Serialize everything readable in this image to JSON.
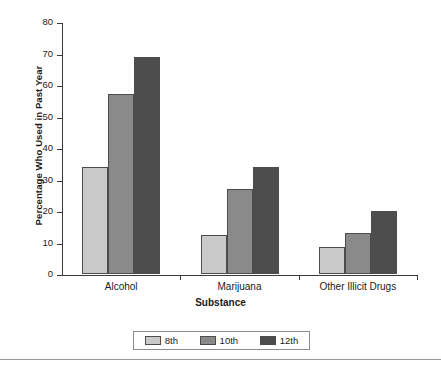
{
  "chart_data": {
    "type": "bar",
    "title": "",
    "xlabel": "Substance",
    "ylabel": "Percentage Who Used in Past Year",
    "categories": [
      "Alcohol",
      "Marijuana",
      "Other Illicit Drugs"
    ],
    "series": [
      {
        "name": "8th",
        "values": [
          34,
          12.5,
          8.5
        ],
        "color": "#c9c9c9"
      },
      {
        "name": "10th",
        "values": [
          57,
          27,
          13
        ],
        "color": "#8a8a8a"
      },
      {
        "name": "12th",
        "values": [
          69,
          34,
          20
        ],
        "color": "#4d4d4d"
      }
    ],
    "ylim": [
      0,
      80
    ],
    "yticks": [
      0,
      10,
      20,
      30,
      40,
      50,
      60,
      70,
      80
    ],
    "ytick_labels": [
      "0",
      "10",
      "20",
      "30",
      "40",
      "50",
      "60",
      "70",
      "80"
    ],
    "grid": false,
    "legend_position": "bottom"
  },
  "legend": {
    "items": [
      {
        "label": "8th"
      },
      {
        "label": "10th"
      },
      {
        "label": "12th"
      }
    ]
  }
}
